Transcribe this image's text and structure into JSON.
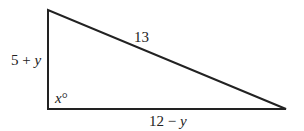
{
  "diagram": {
    "type": "right-triangle",
    "stroke_color": "#222222",
    "vertices": {
      "top_left": {
        "x": 48,
        "y": 10
      },
      "bottom_left": {
        "x": 48,
        "y": 109
      },
      "bottom_right": {
        "x": 286,
        "y": 109
      }
    },
    "labels": {
      "hypotenuse": "13",
      "vertical_leg": {
        "prefix": "5 + ",
        "var": "y"
      },
      "horizontal_leg": {
        "prefix": "12 − ",
        "var": "y"
      },
      "angle": {
        "var": "x",
        "suffix": "°"
      }
    },
    "right_angle_vertex": "bottom_left"
  }
}
